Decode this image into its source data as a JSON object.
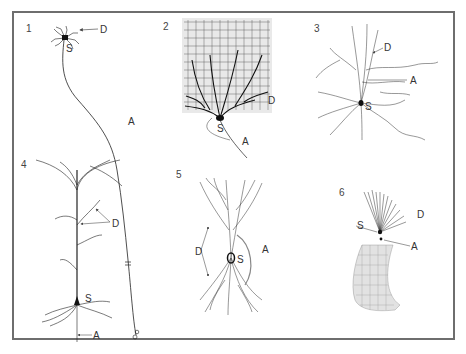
{
  "figure": {
    "panels": [
      {
        "number": "1",
        "labels": {
          "dendrite": "D",
          "soma": "S",
          "axon": "A"
        }
      },
      {
        "number": "2",
        "labels": {
          "dendrite": "D",
          "soma": "S",
          "axon": "A"
        }
      },
      {
        "number": "3",
        "labels": {
          "dendrite": "D",
          "soma": "S",
          "axon": "A"
        }
      },
      {
        "number": "4",
        "labels": {
          "dendrite": "D",
          "soma": "S",
          "axon": "A"
        }
      },
      {
        "number": "5",
        "labels": {
          "dendrite": "D",
          "soma": "S",
          "axon": "A"
        }
      },
      {
        "number": "6",
        "labels": {
          "dendrite": "D",
          "soma": "S",
          "axon": "A"
        }
      }
    ],
    "colors": {
      "frame": "#6e6e6e",
      "ink": "#1a1a1a",
      "label": "#333333",
      "leader": "#555555"
    }
  }
}
